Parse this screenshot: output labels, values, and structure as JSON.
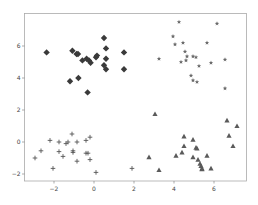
{
  "chart_data": {
    "type": "scatter",
    "title": "",
    "xlabel": "",
    "ylabel": "",
    "xlim": [
      -3.5,
      7.6
    ],
    "ylim": [
      -2.4,
      7.7
    ],
    "xticks": [
      -2,
      0,
      2,
      4,
      6
    ],
    "yticks": [
      -2,
      0,
      2,
      4,
      6
    ],
    "xtick_labels": [
      "−2",
      "0",
      "2",
      "4",
      "6"
    ],
    "ytick_labels": [
      "−2",
      "0",
      "2",
      "4",
      "6"
    ],
    "grid": false,
    "legend": null,
    "series": [
      {
        "name": "cluster-diamond",
        "marker": "diamond",
        "color": "#3a3a3a",
        "points": [
          [
            -2.37,
            5.6
          ],
          [
            -1.08,
            5.7
          ],
          [
            -0.87,
            5.5
          ],
          [
            -0.8,
            5.5
          ],
          [
            -0.58,
            5.1
          ],
          [
            -0.37,
            5.2
          ],
          [
            -0.25,
            5.1
          ],
          [
            -0.17,
            4.95
          ],
          [
            0.1,
            5.3
          ],
          [
            0.15,
            5.4
          ],
          [
            0.5,
            6.5
          ],
          [
            0.6,
            5.85
          ],
          [
            0.6,
            5.2
          ],
          [
            0.5,
            4.8
          ],
          [
            0.6,
            4.55
          ],
          [
            1.5,
            5.6
          ],
          [
            1.5,
            4.55
          ],
          [
            -1.2,
            3.8
          ],
          [
            -0.78,
            4.0
          ],
          [
            -0.32,
            3.1
          ]
        ]
      },
      {
        "name": "cluster-star",
        "marker": "star",
        "color": "#6a6a6a",
        "points": [
          [
            4.25,
            7.5
          ],
          [
            6.15,
            7.4
          ],
          [
            3.95,
            6.6
          ],
          [
            4.05,
            6.1
          ],
          [
            4.45,
            6.2
          ],
          [
            5.65,
            6.2
          ],
          [
            4.55,
            5.65
          ],
          [
            4.65,
            5.35
          ],
          [
            4.95,
            5.35
          ],
          [
            5.1,
            5.3
          ],
          [
            4.35,
            5.0
          ],
          [
            4.6,
            5.1
          ],
          [
            5.25,
            4.75
          ],
          [
            5.85,
            4.95
          ],
          [
            3.25,
            5.2
          ],
          [
            6.55,
            5.15
          ],
          [
            4.85,
            4.15
          ],
          [
            4.95,
            3.85
          ],
          [
            5.15,
            3.75
          ],
          [
            6.55,
            3.35
          ]
        ]
      },
      {
        "name": "cluster-plus",
        "marker": "plus",
        "color": "#555555",
        "points": [
          [
            -2.2,
            0.1
          ],
          [
            -1.75,
            0.0
          ],
          [
            -1.4,
            -0.1
          ],
          [
            -1.3,
            0.0
          ],
          [
            -1.1,
            0.5
          ],
          [
            -0.85,
            0.0
          ],
          [
            -0.4,
            0.1
          ],
          [
            -0.2,
            0.3
          ],
          [
            -2.65,
            -0.55
          ],
          [
            -1.75,
            -0.6
          ],
          [
            -1.05,
            -0.55
          ],
          [
            -1.05,
            -0.65
          ],
          [
            -0.4,
            -0.7
          ],
          [
            -0.3,
            -0.7
          ],
          [
            -2.95,
            -1.0
          ],
          [
            -1.55,
            -0.9
          ],
          [
            -0.85,
            -1.2
          ],
          [
            -0.2,
            -1.1
          ],
          [
            -2.05,
            -1.65
          ],
          [
            0.1,
            -1.9
          ],
          [
            1.9,
            -1.65
          ]
        ]
      },
      {
        "name": "cluster-triangle",
        "marker": "triangle",
        "color": "#5a5a5a",
        "points": [
          [
            3.05,
            1.75
          ],
          [
            6.65,
            1.35
          ],
          [
            7.15,
            1.0
          ],
          [
            6.75,
            0.4
          ],
          [
            4.5,
            0.35
          ],
          [
            4.95,
            0.15
          ],
          [
            6.95,
            -0.25
          ],
          [
            4.5,
            -0.25
          ],
          [
            5.1,
            -0.35
          ],
          [
            5.15,
            -0.4
          ],
          [
            4.4,
            -0.65
          ],
          [
            4.1,
            -0.85
          ],
          [
            5.65,
            -0.85
          ],
          [
            2.75,
            -0.95
          ],
          [
            4.95,
            -0.95
          ],
          [
            5.2,
            -1.1
          ],
          [
            5.3,
            -1.35
          ],
          [
            5.35,
            -1.5
          ],
          [
            5.4,
            -1.65
          ],
          [
            5.4,
            -1.7
          ],
          [
            3.25,
            -1.75
          ],
          [
            5.85,
            -1.65
          ]
        ]
      }
    ]
  }
}
